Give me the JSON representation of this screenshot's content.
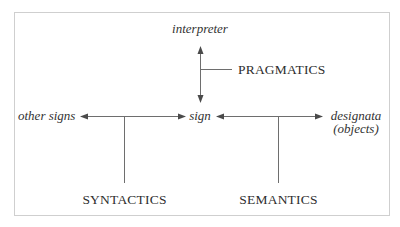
{
  "diagram": {
    "title": "",
    "nodes": {
      "interpreter": "interpreter",
      "sign": "sign",
      "other_signs": "other signs",
      "designata_line1": "designata",
      "designata_line2": "(objects)"
    },
    "relations": {
      "pragmatics": "PRAGMATICS",
      "syntactics": "SYNTACTICS",
      "semantics": "SEMANTICS"
    },
    "edges": [
      {
        "from": "sign",
        "to": "interpreter",
        "label": "PRAGMATICS",
        "bidirectional": true
      },
      {
        "from": "sign",
        "to": "other signs",
        "label": "SYNTACTICS",
        "bidirectional": true
      },
      {
        "from": "sign",
        "to": "designata (objects)",
        "label": "SEMANTICS",
        "bidirectional": true
      }
    ],
    "colors": {
      "line": "#6e6e6e",
      "text": "#333333",
      "frame": "#cfcfcf"
    }
  }
}
